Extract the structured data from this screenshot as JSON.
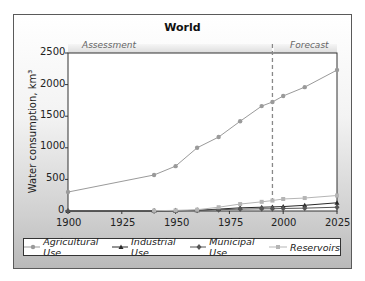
{
  "chart_data": {
    "type": "line",
    "title": "World",
    "xlabel": "",
    "ylabel": "Water consumption, km³",
    "xlim": [
      1900,
      2025
    ],
    "ylim": [
      0,
      2500
    ],
    "x_ticks": [
      "1900",
      "1925",
      "1950",
      "1975",
      "2000",
      "2025"
    ],
    "y_ticks": [
      "0",
      "500",
      "1000",
      "1500",
      "2000",
      "2500"
    ],
    "regions": [
      {
        "label": "Assessment",
        "from": 1900,
        "to": 1995
      },
      {
        "label": "Forecast",
        "from": 1995,
        "to": 2025
      }
    ],
    "divider_year": 1995,
    "legend_position": "bottom",
    "grid": false,
    "series": [
      {
        "name": "Agricultural Use",
        "color": "#9a9a9a",
        "marker": "circle",
        "x": [
          1900,
          1940,
          1950,
          1960,
          1970,
          1980,
          1990,
          1995,
          2000,
          2010,
          2025
        ],
        "values": [
          300,
          570,
          710,
          1000,
          1170,
          1420,
          1660,
          1725,
          1820,
          1960,
          2230
        ]
      },
      {
        "name": "Industrial Use",
        "color": "#2a2a2a",
        "marker": "triangle",
        "x": [
          1900,
          1940,
          1950,
          1960,
          1970,
          1980,
          1990,
          1995,
          2000,
          2010,
          2025
        ],
        "values": [
          0,
          0,
          5,
          10,
          30,
          50,
          60,
          65,
          70,
          90,
          130
        ]
      },
      {
        "name": "Municipal Use",
        "color": "#555555",
        "marker": "diamond",
        "x": [
          1900,
          1940,
          1950,
          1960,
          1970,
          1980,
          1990,
          1995,
          2000,
          2010,
          2025
        ],
        "values": [
          0,
          0,
          5,
          10,
          20,
          30,
          35,
          35,
          40,
          45,
          60
        ]
      },
      {
        "name": "Reservoirs",
        "color": "#b5b5b5",
        "marker": "square",
        "x": [
          1940,
          1950,
          1960,
          1970,
          1980,
          1990,
          1995,
          2000,
          2010,
          2025
        ],
        "values": [
          5,
          10,
          20,
          60,
          110,
          145,
          165,
          190,
          205,
          245
        ]
      }
    ]
  }
}
